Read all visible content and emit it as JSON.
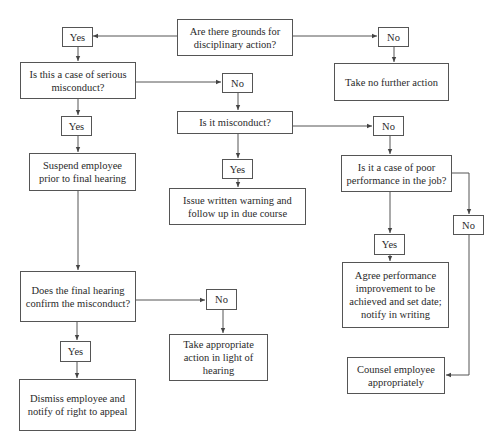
{
  "diagram": {
    "type": "flowchart",
    "nodes": {
      "q_grounds": "Are there grounds for disciplinary action?",
      "yes_grounds": "Yes",
      "no_grounds": "No",
      "take_no_action": "Take no further action",
      "q_serious": "Is this a case of serious misconduct?",
      "no_serious": "No",
      "q_misconduct": "Is it  misconduct?",
      "yes_serious": "Yes",
      "suspend": "Suspend employee prior to final hearing",
      "no_misconduct": "No",
      "q_poor_performance": "Is it a case of poor performance in the job?",
      "yes_misconduct": "Yes",
      "written_warning": "Issue written warning and follow up in due course",
      "no_performance": "No",
      "yes_performance": "Yes",
      "agree_improvement": "Agree performance improvement to be achieved and set date; notify in writing",
      "q_hearing": "Does the final hearing confirm the misconduct?",
      "no_hearing": "No",
      "appropriate_action": "Take appropriate action in light of hearing",
      "yes_hearing": "Yes",
      "counsel": "Counsel employee appropriately",
      "dismiss": "Dismiss employee and notify of right to appeal"
    },
    "edges": [
      [
        "q_grounds",
        "yes_grounds"
      ],
      [
        "q_grounds",
        "no_grounds"
      ],
      [
        "no_grounds",
        "take_no_action"
      ],
      [
        "yes_grounds",
        "q_serious"
      ],
      [
        "q_serious",
        "no_serious"
      ],
      [
        "q_serious",
        "yes_serious"
      ],
      [
        "no_serious",
        "q_misconduct"
      ],
      [
        "yes_serious",
        "suspend"
      ],
      [
        "q_misconduct",
        "no_misconduct"
      ],
      [
        "q_misconduct",
        "yes_misconduct"
      ],
      [
        "yes_misconduct",
        "written_warning"
      ],
      [
        "no_misconduct",
        "q_poor_performance"
      ],
      [
        "q_poor_performance",
        "yes_performance"
      ],
      [
        "q_poor_performance",
        "no_performance"
      ],
      [
        "yes_performance",
        "agree_improvement"
      ],
      [
        "no_performance",
        "counsel"
      ],
      [
        "suspend",
        "q_hearing"
      ],
      [
        "q_hearing",
        "no_hearing"
      ],
      [
        "q_hearing",
        "yes_hearing"
      ],
      [
        "no_hearing",
        "appropriate_action"
      ],
      [
        "yes_hearing",
        "dismiss"
      ]
    ],
    "colors": {
      "line": "#555555",
      "text": "#2a2a2a",
      "background": "#ffffff"
    }
  }
}
